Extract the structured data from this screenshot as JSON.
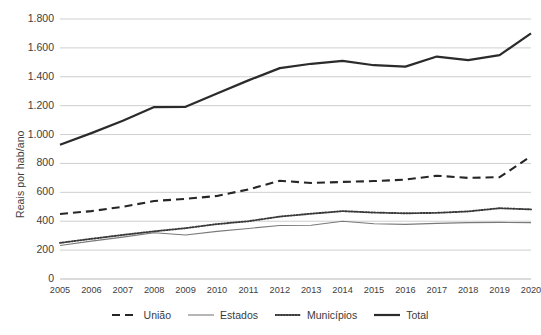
{
  "chart_data": {
    "type": "line",
    "title": "",
    "xlabel": "",
    "ylabel": "Reais por hab/ano",
    "x": [
      2005,
      2006,
      2007,
      2008,
      2009,
      2010,
      2011,
      2012,
      2013,
      2014,
      2015,
      2016,
      2017,
      2018,
      2019,
      2020
    ],
    "categories": [
      "2005",
      "2006",
      "2007",
      "2008",
      "2009",
      "2010",
      "2011",
      "2012",
      "2013",
      "2014",
      "2015",
      "2016",
      "2017",
      "2018",
      "2019",
      "2020"
    ],
    "xlim": [
      2005,
      2020
    ],
    "ylim": [
      0,
      1800
    ],
    "yticks": [
      0,
      200,
      400,
      600,
      800,
      1000,
      1200,
      1400,
      1600,
      1800
    ],
    "ytick_labels": [
      "0",
      "200",
      "400",
      "600",
      "800",
      "1.000",
      "1.200",
      "1.400",
      "1.600",
      "1.800"
    ],
    "grid": "horizontal",
    "legend_position": "bottom",
    "series": [
      {
        "name": "União",
        "style": "dashed",
        "color": "#262626",
        "values": [
          450,
          470,
          500,
          540,
          555,
          575,
          620,
          680,
          665,
          672,
          678,
          688,
          715,
          700,
          705,
          850
        ]
      },
      {
        "name": "Estados",
        "style": "solid-thin",
        "color": "#7a7a7a",
        "values": [
          232,
          262,
          290,
          320,
          305,
          330,
          350,
          370,
          372,
          400,
          383,
          378,
          385,
          390,
          392,
          390
        ]
      },
      {
        "name": "Municípios",
        "style": "dotted",
        "color": "#3a3a3a",
        "values": [
          250,
          278,
          305,
          330,
          352,
          380,
          400,
          432,
          452,
          470,
          460,
          455,
          458,
          468,
          490,
          482
        ]
      },
      {
        "name": "Total",
        "style": "solid-thick",
        "color": "#2b2b2b",
        "values": [
          930,
          1010,
          1095,
          1190,
          1192,
          1285,
          1375,
          1460,
          1490,
          1510,
          1480,
          1470,
          1540,
          1515,
          1550,
          1700
        ]
      }
    ]
  },
  "axis": {
    "y_title": "Reais por hab/ano"
  },
  "legend": {
    "items": [
      {
        "label": "União"
      },
      {
        "label": "Estados"
      },
      {
        "label": "Municípios"
      },
      {
        "label": "Total"
      }
    ]
  }
}
